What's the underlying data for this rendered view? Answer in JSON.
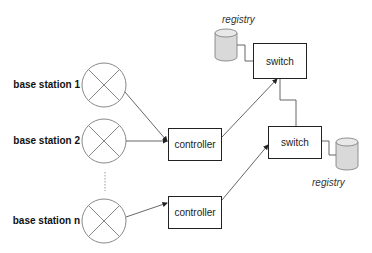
{
  "diagram": {
    "base_stations": [
      {
        "label": "base station 1"
      },
      {
        "label": "base station 2"
      },
      {
        "label": "base station n"
      }
    ],
    "controllers": [
      {
        "label": "controller"
      },
      {
        "label": "controller"
      }
    ],
    "switches": [
      {
        "label": "switch"
      },
      {
        "label": "switch"
      }
    ],
    "registries": [
      {
        "label": "registry"
      },
      {
        "label": "registry"
      }
    ],
    "edges": [
      {
        "from": "base station 1",
        "to": "controller 1",
        "arrow": true
      },
      {
        "from": "base station 2",
        "to": "controller 1",
        "arrow": true
      },
      {
        "from": "base station n",
        "to": "controller 2",
        "arrow": true
      },
      {
        "from": "controller 1",
        "to": "switch 1",
        "arrow": true
      },
      {
        "from": "controller 2",
        "to": "switch 2",
        "arrow": true
      },
      {
        "from": "switch 2",
        "to": "switch 1",
        "arrow": false
      },
      {
        "from": "registry 1",
        "to": "switch 1",
        "arrow": false
      },
      {
        "from": "registry 2",
        "to": "switch 2",
        "arrow": false
      }
    ],
    "colors": {
      "stroke": "#222222",
      "circle_stroke": "#888888",
      "cylinder_fill": "#d9d9d9"
    }
  }
}
